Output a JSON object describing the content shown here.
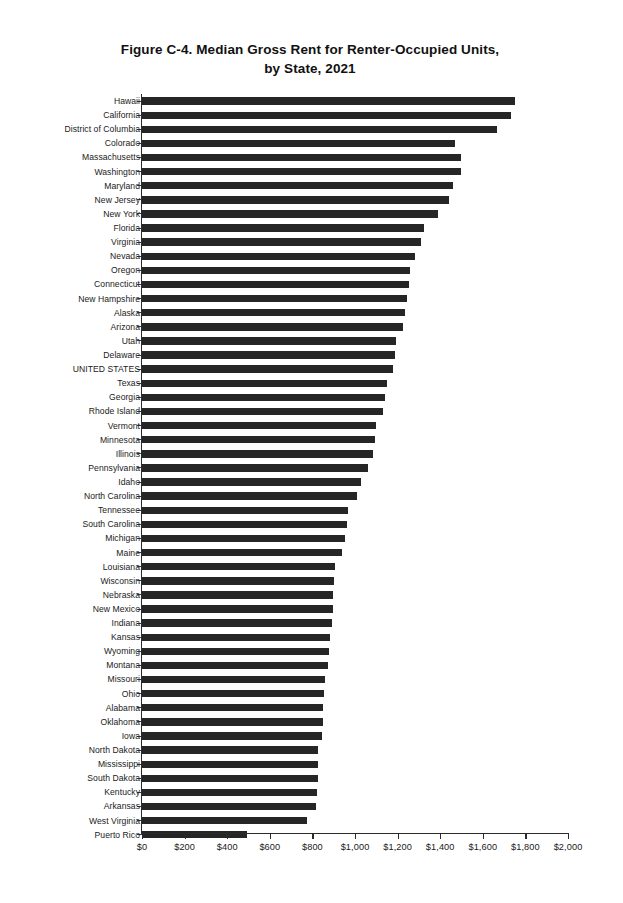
{
  "chart_data": {
    "type": "bar",
    "orientation": "horizontal",
    "title": "Figure C-4. Median Gross Rent for Renter-Occupied Units, by State, 2021",
    "title_line1": "Figure C-4. Median Gross Rent for Renter-Occupied Units,",
    "title_line2": "by State, 2021",
    "xlabel": "",
    "ylabel": "",
    "xlim": [
      0,
      2000
    ],
    "xticks": [
      0,
      200,
      400,
      600,
      800,
      1000,
      1200,
      1400,
      1600,
      1800,
      2000
    ],
    "xtick_labels": [
      "$0",
      "$200",
      "$400",
      "$600",
      "$800",
      "$1,000",
      "$1,200",
      "$1,400",
      "$1,600",
      "$1,800",
      "$2,000"
    ],
    "grid": false,
    "legend": "none",
    "bar_color": "#262626",
    "categories": [
      "Hawaii",
      "California",
      "District of Columbia",
      "Colorado",
      "Massachusetts",
      "Washington",
      "Maryland",
      "New Jersey",
      "New York",
      "Florida",
      "Virginia",
      "Nevada",
      "Oregon",
      "Connecticut",
      "New Hampshire",
      "Alaska",
      "Arizona",
      "Utah",
      "Delaware",
      "UNITED STATES",
      "Texas",
      "Georgia",
      "Rhode Island",
      "Vermont",
      "Minnesota",
      "Illinois",
      "Pennsylvania",
      "Idaho",
      "North Carolina",
      "Tennessee",
      "South Carolina",
      "Michigan",
      "Maine",
      "Louisiana",
      "Wisconsin",
      "Nebraska",
      "New Mexico",
      "Indiana",
      "Kansas",
      "Wyoming",
      "Montana",
      "Missouri",
      "Ohio",
      "Alabama",
      "Oklahoma",
      "Iowa",
      "North Dakota",
      "Mississippi",
      "South Dakota",
      "Kentucky",
      "Arkansas",
      "West Virginia",
      "Puerto Rico"
    ],
    "values": [
      1751,
      1733,
      1665,
      1469,
      1496,
      1496,
      1462,
      1442,
      1390,
      1322,
      1312,
      1282,
      1257,
      1252,
      1242,
      1235,
      1224,
      1193,
      1186,
      1180,
      1150,
      1143,
      1133,
      1100,
      1095,
      1086,
      1060,
      1030,
      1008,
      967,
      962,
      952,
      940,
      905,
      900,
      897,
      895,
      892,
      883,
      878,
      873,
      860,
      855,
      850,
      848,
      845,
      826,
      826,
      826,
      820,
      817,
      775,
      493
    ]
  }
}
